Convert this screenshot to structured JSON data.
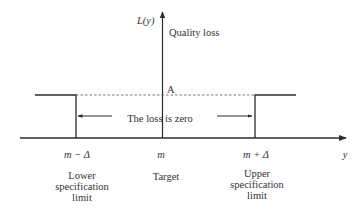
{
  "diagram": {
    "y_axis_label": "L(y)",
    "y_axis_caption": "Quality loss",
    "x_axis_label": "y",
    "level_label": "A",
    "zero_loss_text": "The loss is zero",
    "ticks": [
      {
        "label": "m − Δ",
        "caption_lines": [
          "Lower",
          "specification",
          "limit"
        ]
      },
      {
        "label": "m",
        "caption_lines": [
          "Target"
        ]
      },
      {
        "label": "m + Δ",
        "caption_lines": [
          "Upper",
          "specification",
          "limit"
        ]
      }
    ],
    "colors": {
      "line": "#2b2b2b",
      "text": "#333333",
      "background": "#ffffff"
    }
  }
}
